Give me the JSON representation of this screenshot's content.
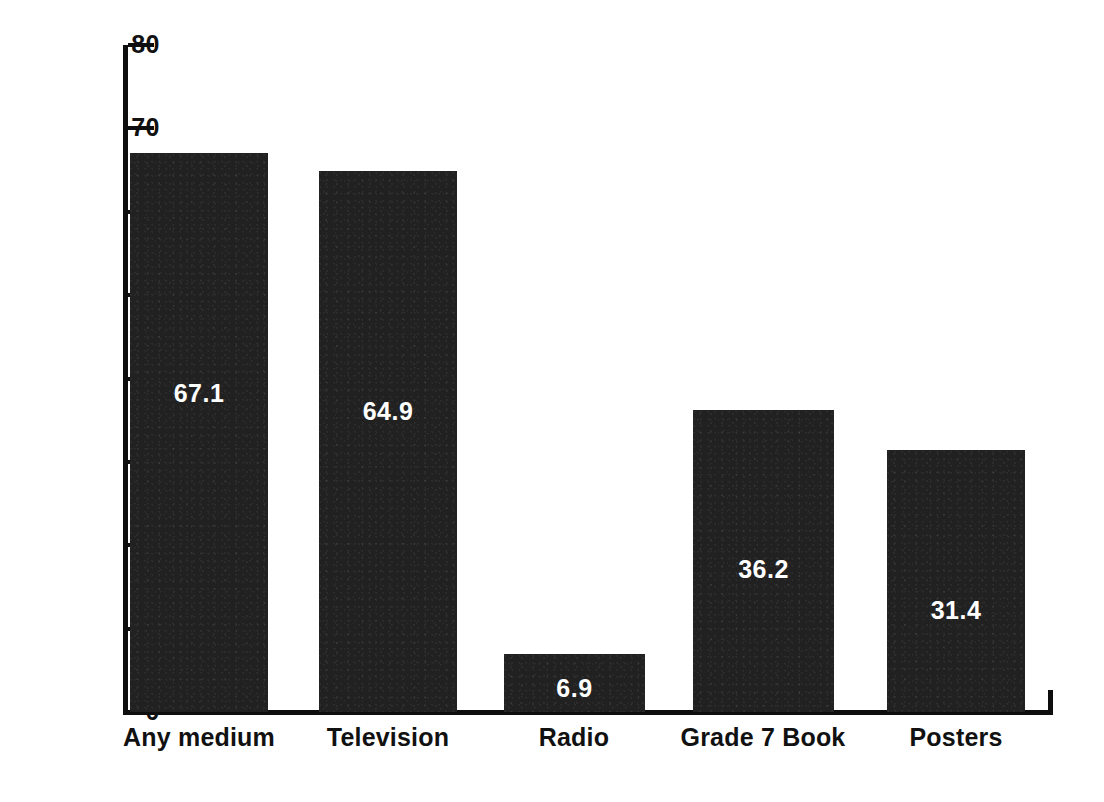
{
  "chart_data": {
    "type": "bar",
    "title": "",
    "subtitle": "",
    "xlabel": "",
    "ylabel": "",
    "categories": [
      "Any medium",
      "Television",
      "Radio",
      "Grade 7 Book",
      "Posters"
    ],
    "values": [
      67.1,
      64.9,
      6.9,
      36.2,
      31.4
    ],
    "value_labels": [
      "67.1",
      "64.9",
      "6.9",
      "36.2",
      "31.4"
    ],
    "ylim": [
      0,
      80
    ],
    "yticks": [
      0,
      10,
      20,
      30,
      40,
      50,
      60,
      70,
      80
    ],
    "ytick_labels": [
      "0",
      "10",
      "20",
      "30",
      "40",
      "50",
      "60",
      "70",
      "80"
    ],
    "grid": false,
    "legend": null,
    "legend_position": "none",
    "bar_color": "#212121",
    "value_label_color": "#ffffff",
    "axis_color": "#0e0e0e",
    "background_color": "#ffffff",
    "annotations": []
  }
}
